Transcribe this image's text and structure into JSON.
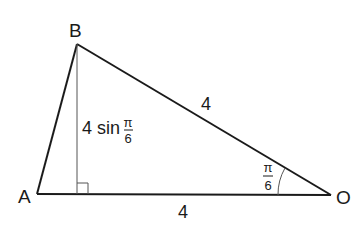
{
  "diagram": {
    "type": "geometry-triangle",
    "colors": {
      "stroke": "#1a1a1a",
      "altitude": "#555555",
      "background": "#ffffff"
    },
    "vertices": {
      "A": {
        "label": "A",
        "x": 37,
        "y": 194
      },
      "B": {
        "label": "B",
        "x": 77,
        "y": 44
      },
      "O": {
        "label": "O",
        "x": 331,
        "y": 195
      }
    },
    "altitude_foot": {
      "x": 77,
      "y": 194
    },
    "labels": {
      "BO_length": "4",
      "AO_length": "4",
      "height_prefix": "4 sin",
      "height_frac_num": "π",
      "height_frac_den": "6",
      "angle_num": "π",
      "angle_den": "6"
    },
    "angle_at_O": "π/6",
    "right_angle_marker": true
  }
}
